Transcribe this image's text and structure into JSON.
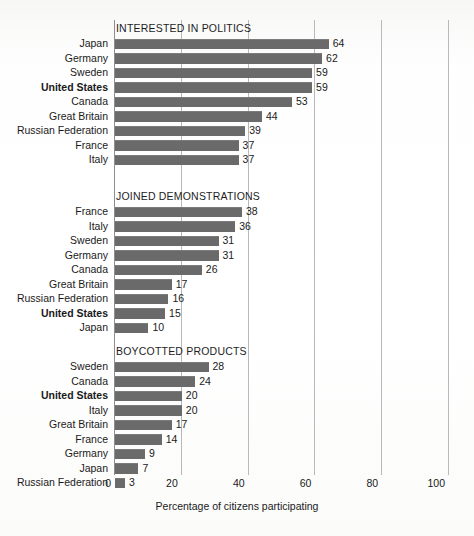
{
  "chart_data": {
    "type": "bar",
    "title": "",
    "xlabel": "Percentage of citizens participating",
    "ylabel": "",
    "xlim": [
      0,
      100
    ],
    "xticks": [
      0,
      20,
      40,
      60,
      80,
      100
    ],
    "xtick_labels": [
      "0",
      "20",
      "40",
      "60",
      "80",
      "100"
    ],
    "grid": true,
    "orientation": "horizontal",
    "legend": "none",
    "highlight_category": "United States",
    "bar_color": "#6a6a6a",
    "grid_color": "#b9b9b9",
    "panels": [
      {
        "title": "INTERESTED IN POLITICS",
        "categories": [
          "Japan",
          "Germany",
          "Sweden",
          "United States",
          "Canada",
          "Great Britain",
          "Russian Federation",
          "France",
          "Italy"
        ],
        "values": [
          64,
          62,
          59,
          59,
          53,
          44,
          39,
          37,
          37
        ]
      },
      {
        "title": "JOINED DEMONSTRATIONS",
        "categories": [
          "France",
          "Italy",
          "Sweden",
          "Germany",
          "Canada",
          "Great Britain",
          "Russian Federation",
          "United States",
          "Japan"
        ],
        "values": [
          38,
          36,
          31,
          31,
          26,
          17,
          16,
          15,
          10
        ]
      },
      {
        "title": "BOYCOTTED PRODUCTS",
        "categories": [
          "Sweden",
          "Canada",
          "United States",
          "Italy",
          "Great Britain",
          "France",
          "Germany",
          "Japan",
          "Russian Federation"
        ],
        "values": [
          28,
          24,
          20,
          20,
          17,
          14,
          9,
          7,
          3
        ]
      }
    ]
  }
}
